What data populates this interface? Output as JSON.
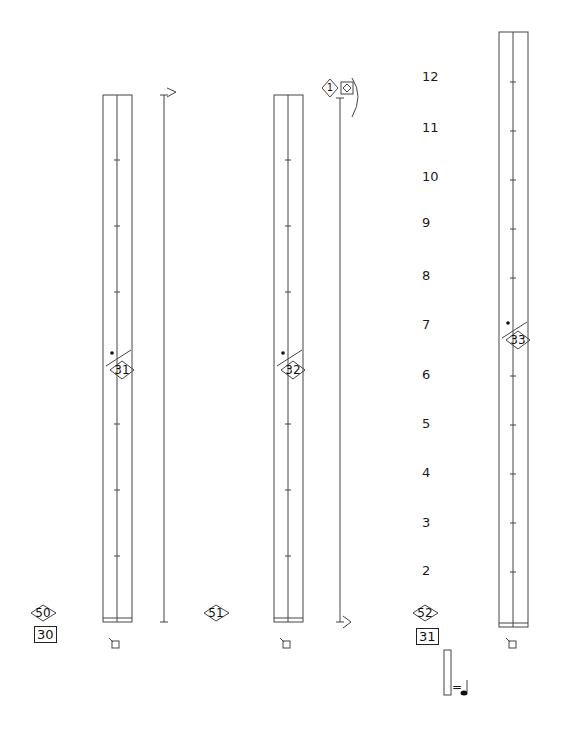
{
  "score": {
    "staves": [
      {
        "id": "staff-1",
        "marker": "31",
        "bottom_section": "50",
        "bottom_box": "30"
      },
      {
        "id": "staff-2",
        "marker": "32",
        "bottom_section": "51",
        "bottom_box": ""
      },
      {
        "id": "staff-3",
        "marker": "33",
        "bottom_section": "52",
        "bottom_box": "31"
      }
    ],
    "top_marker": {
      "diamond": "1"
    },
    "scale_numbers": [
      "12",
      "11",
      "10",
      "9",
      "8",
      "7",
      "6",
      "5",
      "4",
      "3",
      "2"
    ],
    "legend": {
      "equals": "="
    }
  }
}
